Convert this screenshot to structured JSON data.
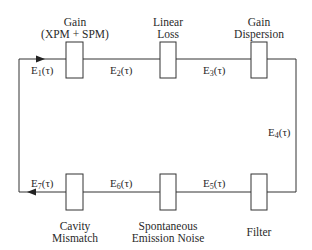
{
  "diagram": {
    "top_components": [
      {
        "line1": "Gain",
        "line2": "(XPM + SPM)"
      },
      {
        "line1": "Linear",
        "line2": "Loss"
      },
      {
        "line1": "Gain",
        "line2": "Dispersion"
      }
    ],
    "bottom_components": [
      {
        "line1": "Cavity",
        "line2": "Mismatch"
      },
      {
        "line1": "Spontaneous",
        "line2": "Emission Noise"
      },
      {
        "line1": "Filter",
        "line2": ""
      }
    ],
    "signals": [
      {
        "base": "E",
        "sub": "1",
        "arg": "(τ)"
      },
      {
        "base": "E",
        "sub": "2",
        "arg": "(τ)"
      },
      {
        "base": "E",
        "sub": "3",
        "arg": "(τ)"
      },
      {
        "base": "E",
        "sub": "4",
        "arg": "(τ)"
      },
      {
        "base": "E",
        "sub": "5",
        "arg": "(τ)"
      },
      {
        "base": "E",
        "sub": "6",
        "arg": "(τ)"
      },
      {
        "base": "E",
        "sub": "7",
        "arg": "(τ)"
      }
    ],
    "line_color": "#333333"
  }
}
